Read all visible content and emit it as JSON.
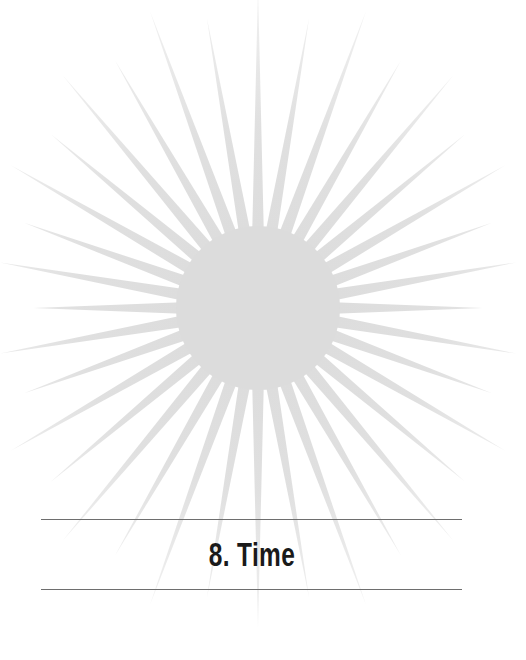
{
  "chapter": {
    "number": "8.",
    "title": "Time",
    "heading": "8. Time"
  },
  "illustration": {
    "icon": "sunburst-icon",
    "center": [
      258,
      308
    ],
    "core_radius": 80,
    "ray_count": 36,
    "color": "#dcdcdc"
  },
  "colors": {
    "background": "#ffffff",
    "rule": "#6e6e6e",
    "text": "#1a1a1a"
  }
}
